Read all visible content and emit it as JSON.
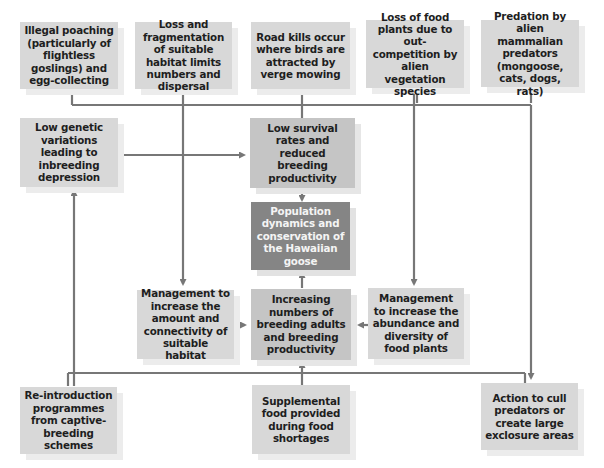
{
  "diagram": {
    "title": "Population dynamics and conservation of the Hawaiian goose",
    "threats": [
      {
        "id": "poaching",
        "label": "Illegal poaching (particularly of flightless goslings) and egg-collecting"
      },
      {
        "id": "habitat_loss",
        "label": "Loss and fragmentation of suitable habitat limits numbers and dispersal"
      },
      {
        "id": "road_kills",
        "label": "Road kills occur where birds are attracted by verge mowing"
      },
      {
        "id": "food_loss",
        "label": "Loss of food plants due to out-competition by alien vegetation species"
      },
      {
        "id": "predation",
        "label": "Predation by alien mammalian predators (mongoose, cats, dogs, rats)"
      }
    ],
    "low_genetic": {
      "label": "Low genetic variations leading to inbreeding depression"
    },
    "low_survival": {
      "label": "Low survival rates and reduced breeding productivity"
    },
    "center": {
      "label": "Population dynamics and conservation of the Hawaiian goose"
    },
    "increasing": {
      "label": "Increasing numbers of breeding adults and breeding productivity"
    },
    "mgmt_habitat": {
      "label": "Management to increase the amount and connectivity of suitable habitat"
    },
    "mgmt_food": {
      "label": "Management to increase the abundance and diversity of food plants"
    },
    "actions": [
      {
        "id": "reintroduction",
        "label": "Re-introduction programmes from captive-breeding schemes"
      },
      {
        "id": "supplemental",
        "label": "Supplemental food provided during food shortages"
      },
      {
        "id": "cull",
        "label": "Action to cull predators or create large exclosure areas"
      }
    ],
    "colors": {
      "box_light": "#d8d8d8",
      "box_mid": "#c5c5c5",
      "box_dark": "#858585",
      "connector": "#777777"
    }
  }
}
